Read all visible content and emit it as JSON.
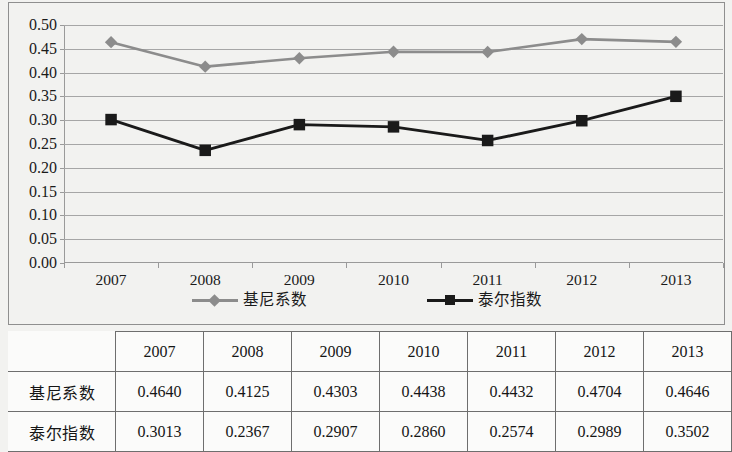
{
  "chart_data": {
    "type": "line",
    "title": "",
    "xlabel": "",
    "ylabel": "",
    "categories": [
      "2007",
      "2008",
      "2009",
      "2010",
      "2011",
      "2012",
      "2013"
    ],
    "series": [
      {
        "name": "基尼系数",
        "color": "#8c8c8c",
        "marker": "diamond",
        "values": [
          0.464,
          0.4125,
          0.4303,
          0.4438,
          0.4432,
          0.4704,
          0.4646
        ]
      },
      {
        "name": "泰尔指数",
        "color": "#1a1a1a",
        "marker": "square",
        "values": [
          0.3013,
          0.2367,
          0.2907,
          0.286,
          0.2574,
          0.2989,
          0.3502
        ]
      }
    ],
    "ylim": [
      0.0,
      0.5
    ],
    "ytick_step": 0.05,
    "ytick_labels": [
      "0.50",
      "0.45",
      "0.40",
      "0.35",
      "0.30",
      "0.25",
      "0.20",
      "0.15",
      "0.10",
      "0.05",
      "0.00"
    ],
    "grid": true,
    "legend_position": "bottom"
  },
  "legend": {
    "entries": [
      {
        "label": "基尼系数"
      },
      {
        "label": "泰尔指数"
      }
    ]
  },
  "table": {
    "corner_label": "",
    "column_headers": [
      "2007",
      "2008",
      "2009",
      "2010",
      "2011",
      "2012",
      "2013"
    ],
    "rows": [
      {
        "header": "基尼系数",
        "cells": [
          "0.4640",
          "0.4125",
          "0.4303",
          "0.4438",
          "0.4432",
          "0.4704",
          "0.4646"
        ]
      },
      {
        "header": "泰尔指数",
        "cells": [
          "0.3013",
          "0.2367",
          "0.2907",
          "0.2860",
          "0.2574",
          "0.2989",
          "0.3502"
        ]
      }
    ]
  }
}
